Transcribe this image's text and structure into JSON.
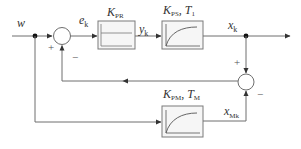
{
  "diagram": {
    "type": "block-diagram",
    "title": "",
    "signals": {
      "input": {
        "base": "w",
        "sub": ""
      },
      "error": {
        "base": "e",
        "sub": "k"
      },
      "controller_output": {
        "base": "y",
        "sub": "k"
      },
      "process_output": {
        "base": "x",
        "sub": "k"
      },
      "model_output": {
        "base": "x",
        "sub": "Mk"
      }
    },
    "blocks": [
      {
        "id": "controller",
        "label_base": "K",
        "label_sub": "PR",
        "label_extra": "",
        "icon": "p-controller-step-icon"
      },
      {
        "id": "process",
        "label_base": "K",
        "label_sub": "PS",
        "label_extra": "T",
        "label_extra_sub": "1",
        "icon": "first-order-lag-icon"
      },
      {
        "id": "model",
        "label_base": "K",
        "label_sub": "PM",
        "label_extra": "T",
        "label_extra_sub": "M",
        "icon": "first-order-lag-icon"
      }
    ],
    "summing_junctions": [
      {
        "id": "sum1",
        "plus": "+",
        "minus": "−"
      },
      {
        "id": "sum2",
        "plus": "+",
        "minus": "−"
      }
    ],
    "colors": {
      "line": "#6e6e6e",
      "box_fill": "#f6f6f6",
      "box_stroke": "#7a7a7a",
      "text": "#333333"
    }
  }
}
